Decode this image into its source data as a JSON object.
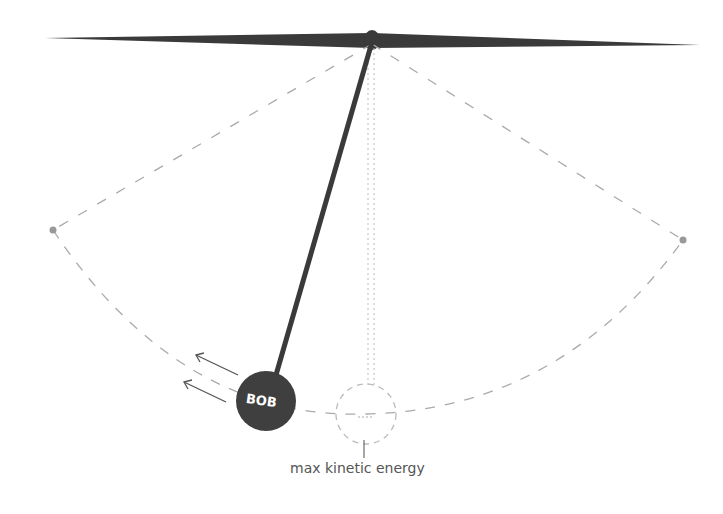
{
  "diagram": {
    "type": "pendulum",
    "bob_label": "BOB",
    "rest_position_label": "max kinetic energy",
    "colors": {
      "rod": "#3a3a3a",
      "bob": "#3f3f3f",
      "dashed": "#aaaaaa",
      "text": "#555555"
    }
  }
}
